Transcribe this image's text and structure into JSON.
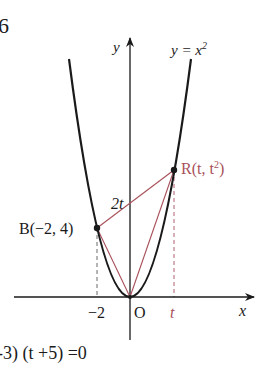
{
  "problem_number": "6",
  "colors": {
    "ink": "#1a1a1a",
    "accent": "#a8505a"
  },
  "axes": {
    "x_label": "x",
    "y_label": "y",
    "origin_label": "O",
    "x_tick_neg2": "−2",
    "x_tick_t": "t"
  },
  "curve": {
    "label": "y = x²",
    "label_base": "y = x",
    "label_exp": "2"
  },
  "points": {
    "B": {
      "label": "B(−2, 4)"
    },
    "R": {
      "label_base": "R(t, t",
      "label_exp": "2",
      "label_close": ")"
    }
  },
  "segment_label": "2t",
  "bottom_equation": "-3) (t +5) =0"
}
